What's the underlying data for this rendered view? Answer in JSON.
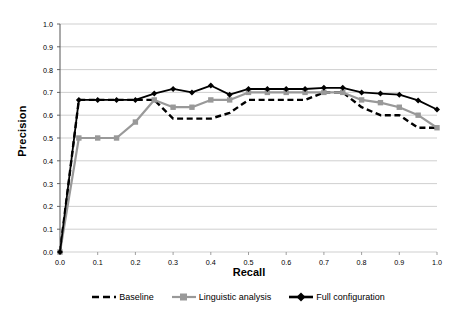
{
  "chart_data": {
    "type": "line",
    "title": "",
    "xlabel": "Recall",
    "ylabel": "Precision",
    "xlim": [
      0.0,
      1.0
    ],
    "ylim": [
      0.0,
      1.0
    ],
    "xticks": [
      "0.0",
      "0.1",
      "0.2",
      "0.3",
      "0.4",
      "0.5",
      "0.6",
      "0.7",
      "0.8",
      "0.9",
      "1.0"
    ],
    "yticks": [
      "0.0",
      "0.1",
      "0.2",
      "0.3",
      "0.4",
      "0.5",
      "0.6",
      "0.7",
      "0.8",
      "0.9",
      "1.0"
    ],
    "grid": "horizontal",
    "legend_position": "bottom",
    "x": [
      0.0,
      0.05,
      0.1,
      0.15,
      0.2,
      0.25,
      0.3,
      0.35,
      0.4,
      0.45,
      0.5,
      0.55,
      0.6,
      0.65,
      0.7,
      0.75,
      0.8,
      0.85,
      0.9,
      0.95,
      1.0
    ],
    "series": [
      {
        "name": "Baseline",
        "color": "#000000",
        "style": "dashed",
        "marker": "none",
        "values": [
          0.0,
          0.667,
          0.667,
          0.667,
          0.667,
          0.667,
          0.585,
          0.585,
          0.585,
          0.61,
          0.667,
          0.667,
          0.667,
          0.667,
          0.7,
          0.7,
          0.635,
          0.6,
          0.6,
          0.545,
          0.545
        ]
      },
      {
        "name": "Linguistic analysis",
        "color": "#999999",
        "style": "solid",
        "marker": "square",
        "values": [
          0.0,
          0.5,
          0.5,
          0.5,
          0.57,
          0.667,
          0.635,
          0.635,
          0.667,
          0.667,
          0.7,
          0.7,
          0.7,
          0.7,
          0.7,
          0.7,
          0.667,
          0.655,
          0.635,
          0.6,
          0.545
        ]
      },
      {
        "name": "Full configuration",
        "color": "#000000",
        "style": "solid",
        "marker": "diamond",
        "values": [
          0.0,
          0.667,
          0.667,
          0.667,
          0.667,
          0.695,
          0.715,
          0.7,
          0.73,
          0.69,
          0.715,
          0.715,
          0.715,
          0.715,
          0.72,
          0.72,
          0.7,
          0.695,
          0.69,
          0.665,
          0.625
        ]
      }
    ]
  },
  "axis": {
    "x_title": "Recall",
    "y_title": "Precision"
  },
  "legend": {
    "items": [
      {
        "label": "Baseline",
        "key": "dashed-black-line-key"
      },
      {
        "label": "Linguistic analysis",
        "key": "solid-gray-line-square-key"
      },
      {
        "label": "Full configuration",
        "key": "solid-black-line-diamond-key"
      }
    ]
  }
}
